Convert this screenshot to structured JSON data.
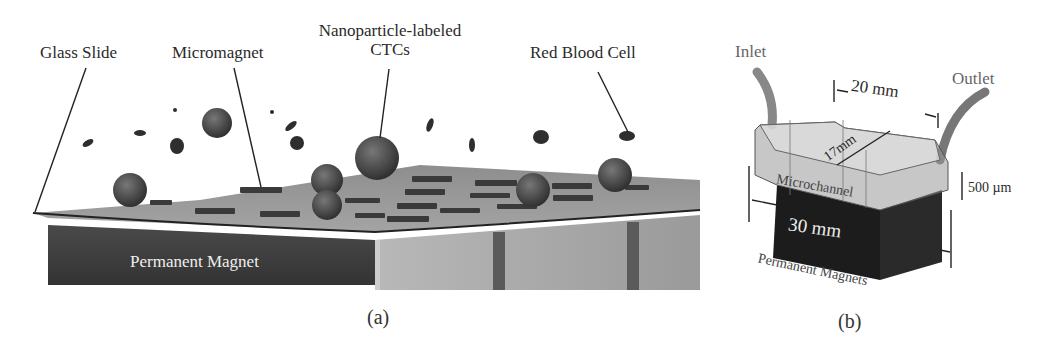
{
  "figure": {
    "panel_a": {
      "label": "(a)",
      "callouts": {
        "glass_slide": "Glass Slide",
        "micromagnet": "Micromagnet",
        "ctc_line1": "Nanoparticle-labeled",
        "ctc_line2": "CTCs",
        "red_blood_cell": "Red Blood Cell"
      },
      "magnet_label": "Permanent Magnet"
    },
    "panel_b": {
      "label": "(b)",
      "inlet": "Inlet",
      "outlet": "Outlet",
      "dim_length": "20 mm",
      "dim_width": "17mm",
      "dim_height": "500 µm",
      "channel_label": "Microchannel",
      "magnet_size": "30 mm",
      "magnets_label": "Permanent Magnets"
    }
  }
}
